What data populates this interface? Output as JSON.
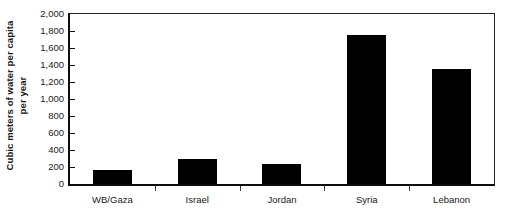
{
  "chart_data": {
    "type": "bar",
    "title": "",
    "subtitle": "",
    "xlabel": "",
    "ylabel": "Cubic meters of water per capita per year",
    "ylabel_lines": [
      "Cubic meters of water per capita",
      "per year"
    ],
    "categories": [
      "WB/Gaza",
      "Israel",
      "Jordan",
      "Syria",
      "Lebanon"
    ],
    "values": [
      160,
      290,
      240,
      1750,
      1350
    ],
    "ylim": [
      0,
      2000
    ],
    "ytick_step": 200,
    "ytick_labels": [
      "0",
      "200",
      "400",
      "600",
      "800",
      "1,000",
      "1,200",
      "1,400",
      "1,600",
      "1,800",
      "2,000"
    ],
    "ytick_values": [
      0,
      200,
      400,
      600,
      800,
      1000,
      1200,
      1400,
      1600,
      1800,
      2000
    ],
    "grid": false,
    "legend": false,
    "legend_position": "none",
    "bar_color": "#000000",
    "axis_color": "#0d0d0d",
    "frame_color": "#262626",
    "background_color": "#ffffff"
  }
}
